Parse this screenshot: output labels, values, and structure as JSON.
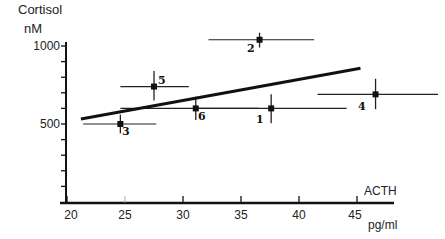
{
  "chart_data": {
    "type": "scatter",
    "title": "",
    "ylabel": "Cortisol",
    "ylabel_unit": "nM",
    "xlabel": "ACTH",
    "xlabel_unit": "pg/ml",
    "xlim": [
      20,
      48
    ],
    "ylim": [
      0,
      1000
    ],
    "x_ticks": [
      20,
      25,
      30,
      35,
      40,
      45
    ],
    "y_ticks_labeled": [
      500,
      1000
    ],
    "y_minor_step": 100,
    "grid": false,
    "legend": null,
    "points": [
      {
        "label": "1",
        "x": 37.6,
        "y": 600,
        "x_err_low": 31.1,
        "x_err_high": 44.1,
        "y_err_low": 505,
        "y_err_high": 690
      },
      {
        "label": "2",
        "x": 36.6,
        "y": 1040,
        "x_err_low": 32.2,
        "x_err_high": 41.3,
        "y_err_low": 990,
        "y_err_high": 1085
      },
      {
        "label": "3",
        "x": 24.6,
        "y": 500,
        "x_err_low": 21.4,
        "x_err_high": 27.7,
        "y_err_low": 440,
        "y_err_high": 560
      },
      {
        "label": "4",
        "x": 46.6,
        "y": 690,
        "x_err_low": 41.6,
        "x_err_high": 52.0,
        "y_err_low": 595,
        "y_err_high": 790
      },
      {
        "label": "5",
        "x": 27.5,
        "y": 740,
        "x_err_low": 24.6,
        "x_err_high": 30.5,
        "y_err_low": 650,
        "y_err_high": 840
      },
      {
        "label": "6",
        "x": 31.1,
        "y": 600,
        "x_err_low": 24.6,
        "x_err_high": 36.5,
        "y_err_low": 525,
        "y_err_high": 675
      }
    ],
    "regression_line": {
      "x": [
        21.2,
        45.3
      ],
      "y": [
        532,
        858
      ]
    }
  },
  "axes": {
    "y_title": "Cortisol",
    "y_unit": "nM",
    "y_tick_1000": "1000",
    "y_tick_500": "500",
    "x_title": "ACTH",
    "x_unit": "pg/ml",
    "x_ticks": [
      "20",
      "25",
      "30",
      "35",
      "40",
      "45"
    ]
  },
  "point_labels": [
    "1",
    "2",
    "3",
    "4",
    "5",
    "6"
  ]
}
